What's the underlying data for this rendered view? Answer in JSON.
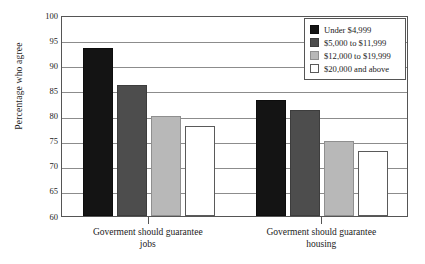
{
  "chart_data": {
    "type": "bar",
    "title": "",
    "subtitle": "",
    "xlabel": "",
    "ylabel": "Percentage who agree",
    "ylim": [
      60,
      100
    ],
    "ytick_labels": [
      "100",
      "95",
      "90",
      "85",
      "80",
      "75",
      "70",
      "65",
      "60"
    ],
    "ytick_values": [
      100,
      95,
      90,
      85,
      80,
      75,
      70,
      65,
      60
    ],
    "grid": true,
    "legend_position": "top-right",
    "categories": [
      "Goverment should guarantee jobs",
      "Goverment should guarantee housing"
    ],
    "category_lines": [
      [
        "Goverment should guarantee",
        "jobs"
      ],
      [
        "Goverment should guarantee",
        "housing"
      ]
    ],
    "series": [
      {
        "name": "Under $4,999",
        "color": "#141414",
        "values": [
          93.5,
          83
        ]
      },
      {
        "name": "$5,000 to $11,999",
        "color": "#4d4d4d",
        "values": [
          86,
          81
        ]
      },
      {
        "name": "$12,000 to $19,999",
        "color": "#b8b8b8",
        "values": [
          80,
          75
        ]
      },
      {
        "name": "$20,000 and above",
        "color": "#ffffff",
        "values": [
          78,
          73
        ]
      }
    ]
  },
  "legend": {
    "items": [
      {
        "label": "Under $4,999",
        "swatch": "swatch-black"
      },
      {
        "label": "$5,000 to $11,999",
        "swatch": "swatch-dgray"
      },
      {
        "label": "$12,000 to $19,999",
        "swatch": "swatch-lgray"
      },
      {
        "label": "$20,000 and above",
        "swatch": "swatch-white"
      }
    ]
  }
}
